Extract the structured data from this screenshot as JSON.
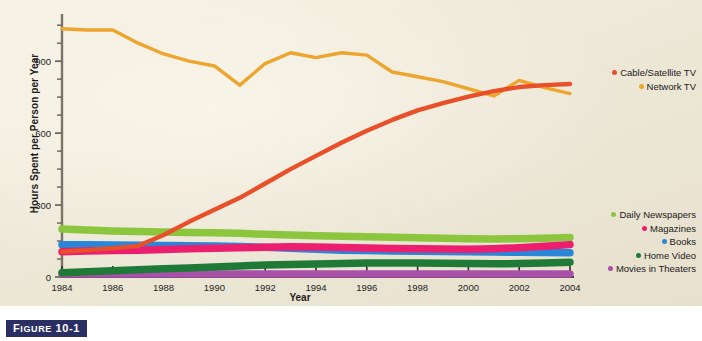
{
  "figure": {
    "caption_prefix": "F",
    "caption_word": "IGURE",
    "caption_number": "10-1"
  },
  "chart_data": {
    "type": "line",
    "title": "",
    "xlabel": "Year",
    "ylabel": "Hours Spent per Person per Year",
    "x": [
      1984,
      1985,
      1986,
      1987,
      1988,
      1989,
      1990,
      1991,
      1992,
      1993,
      1994,
      1995,
      1996,
      1997,
      1998,
      1999,
      2000,
      2001,
      2002,
      2003,
      2004
    ],
    "xlim": [
      1984,
      2004
    ],
    "ylim": [
      0,
      1080
    ],
    "xticks": [
      "1984",
      "1986",
      "1988",
      "1990",
      "1992",
      "1994",
      "1996",
      "1998",
      "2000",
      "2002",
      "2004"
    ],
    "yticks": [
      "0",
      "300",
      "600",
      "900"
    ],
    "y_minor_ticks": [
      75,
      150,
      225,
      375,
      450,
      525,
      675,
      750,
      825,
      975,
      1050
    ],
    "grid": false,
    "legend_position": "right",
    "series": [
      {
        "name": "Cable/Satellite TV",
        "color": "#e8502a",
        "values": [
          105,
          112,
          120,
          130,
          175,
          230,
          280,
          330,
          390,
          450,
          505,
          560,
          610,
          655,
          695,
          725,
          752,
          775,
          792,
          800,
          805
        ]
      },
      {
        "name": "Network TV",
        "color": "#eda52e",
        "values": [
          1035,
          1030,
          1030,
          975,
          930,
          900,
          880,
          800,
          890,
          935,
          915,
          935,
          925,
          855,
          835,
          815,
          785,
          755,
          820,
          790,
          765
        ]
      },
      {
        "name": "Daily Newspapers",
        "color": "#8cc63f",
        "values": [
          200,
          196,
          192,
          190,
          188,
          186,
          184,
          182,
          178,
          175,
          172,
          170,
          168,
          166,
          164,
          162,
          160,
          158,
          160,
          162,
          165
        ]
      },
      {
        "name": "Magazines",
        "color": "#ec1f6e",
        "values": [
          105,
          108,
          110,
          112,
          115,
          118,
          120,
          122,
          124,
          126,
          125,
          123,
          121,
          119,
          118,
          117,
          116,
          118,
          122,
          128,
          135
        ]
      },
      {
        "name": "Books",
        "color": "#2a86d8",
        "values": [
          135,
          134,
          133,
          132,
          131,
          130,
          129,
          127,
          124,
          120,
          116,
          112,
          110,
          108,
          107,
          106,
          105,
          104,
          103,
          102,
          101
        ]
      },
      {
        "name": "Home Video",
        "color": "#1f7a38",
        "values": [
          18,
          22,
          26,
          30,
          34,
          38,
          42,
          46,
          50,
          52,
          54,
          56,
          58,
          58,
          58,
          57,
          56,
          55,
          56,
          58,
          62
        ]
      },
      {
        "name": "Movies in Theaters",
        "color": "#a851a8",
        "values": [
          12,
          12,
          12,
          12,
          12,
          12,
          12,
          12,
          12,
          12,
          12,
          12,
          12,
          12,
          12,
          12,
          12,
          12,
          12,
          12,
          12
        ]
      }
    ]
  },
  "legend_top": [
    {
      "label": "Cable/Satellite TV",
      "color": "#e8502a"
    },
    {
      "label": "Network TV",
      "color": "#eda52e"
    }
  ],
  "legend_bottom": [
    {
      "label": "Daily Newspapers",
      "color": "#8cc63f"
    },
    {
      "label": "Magazines",
      "color": "#ec1f6e"
    },
    {
      "label": "Books",
      "color": "#2a86d8"
    },
    {
      "label": "Home Video",
      "color": "#1f7a38"
    },
    {
      "label": "Movies in Theaters",
      "color": "#a851a8"
    }
  ]
}
